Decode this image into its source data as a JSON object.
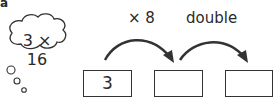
{
  "part_label": "a",
  "thought_bubble": {
    "text": "3 × 16"
  },
  "boxes": [
    {
      "value": "3"
    },
    {
      "value": ""
    },
    {
      "value": ""
    }
  ],
  "operations": [
    {
      "label": "× 8"
    },
    {
      "label": "double"
    }
  ]
}
